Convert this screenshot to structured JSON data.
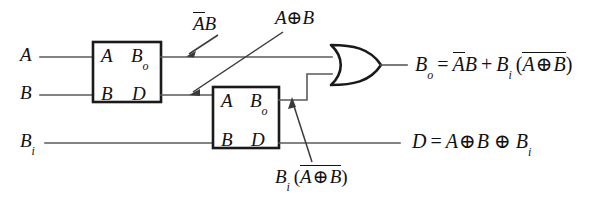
{
  "figure": {
    "kind": "logic-circuit-diagram",
    "background_color": "#ffffff",
    "wire_color": "#5a5a5a",
    "outline_color": "#1a1a1a"
  },
  "inputs": [
    {
      "id": "a",
      "label": "A",
      "sub": "",
      "y": 57
    },
    {
      "id": "b",
      "label": "B",
      "sub": "",
      "y": 95
    },
    {
      "id": "bi",
      "label": "B",
      "sub": "i",
      "y": 143
    }
  ],
  "blocks": [
    {
      "id": "block1",
      "name": "half-subtractor-1",
      "ports": {
        "in_top": "A",
        "in_bottom": "B",
        "out_top": "B",
        "out_top_sub": "o",
        "out_bottom": "D"
      }
    },
    {
      "id": "block2",
      "name": "half-subtractor-2",
      "ports": {
        "in_top": "A",
        "in_bottom": "B",
        "out_top": "B",
        "out_top_sub": "o",
        "out_bottom": "D"
      }
    }
  ],
  "gate": {
    "id": "or1",
    "type": "OR",
    "name": "or-gate",
    "inputs": 2
  },
  "annotations": [
    {
      "id": "ann_ab",
      "name": "annotation-a-bar-b",
      "text_parts": {
        "overlined": "A",
        "plain": "B"
      },
      "plain_text": "ĀB",
      "points_to": "block1-borrow-output-wire"
    },
    {
      "id": "ann_axorb",
      "name": "annotation-a-xor-b",
      "plain_text": "A⊕B",
      "points_to": "block1-difference-output-wire"
    },
    {
      "id": "ann_bi_axorb",
      "name": "annotation-bi-times-not-a-xor-b",
      "plain_text": "Bi(A⊕B)",
      "points_to": "block2-borrow-output-wire"
    }
  ],
  "outputs": [
    {
      "id": "bo_eq",
      "name": "output-equation-borrow",
      "plain_text": "Bo = ĀB + Bi(A⊕B)",
      "lhs": "B",
      "lhs_sub": "o",
      "y": 65
    },
    {
      "id": "d_eq",
      "name": "output-equation-difference",
      "plain_text": "D = A⊕B⊕Bi",
      "lhs": "D",
      "y": 143
    }
  ],
  "symbols": {
    "xor": "⊕",
    "plus": "+",
    "equals": "=",
    "paren_open": "(",
    "paren_close": ")"
  }
}
